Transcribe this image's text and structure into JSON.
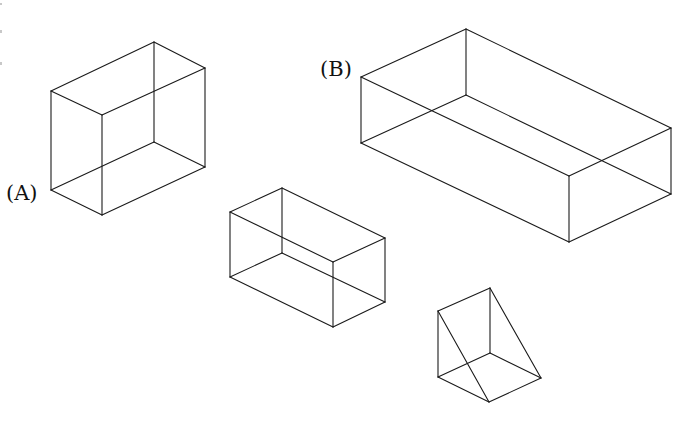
{
  "figure": {
    "background": "#ffffff",
    "line_color": "#1a1a1a",
    "labels": [
      {
        "id": "A",
        "text": "(A)",
        "x": 6,
        "y": 200
      },
      {
        "id": "B",
        "text": "(B)",
        "x": 320,
        "y": 76
      }
    ],
    "shapes": [
      {
        "name": "box-a",
        "type": "rectangular-prism",
        "label": "(A)",
        "vertices": {
          "top_left": [
            51,
            91
          ],
          "top_back": [
            154,
            42
          ],
          "top_right": [
            205,
            68
          ],
          "top_front": [
            102,
            115
          ],
          "bottom_left": [
            51,
            190
          ],
          "bottom_back": [
            154,
            142
          ],
          "bottom_right": [
            205,
            167
          ],
          "bottom_front": [
            102,
            215
          ]
        }
      },
      {
        "name": "box-b",
        "type": "rectangular-prism",
        "label": "(B)",
        "vertices": {
          "top_left": [
            361,
            77
          ],
          "top_back": [
            466,
            29
          ],
          "top_right": [
            671,
            128
          ],
          "top_front": [
            569,
            176
          ],
          "bottom_left": [
            361,
            143
          ],
          "bottom_back": [
            466,
            95
          ],
          "bottom_right": [
            671,
            194
          ],
          "bottom_front": [
            569,
            242
          ]
        }
      },
      {
        "name": "box-c",
        "type": "rectangular-prism",
        "label": "",
        "vertices": {
          "top_left": [
            230,
            212
          ],
          "top_back": [
            282,
            188
          ],
          "top_right": [
            385,
            238
          ],
          "top_front": [
            333,
            262
          ],
          "bottom_left": [
            230,
            277
          ],
          "bottom_back": [
            282,
            253
          ],
          "bottom_right": [
            385,
            302
          ],
          "bottom_front": [
            333,
            327
          ]
        }
      },
      {
        "name": "wedge-d",
        "type": "triangular-prism",
        "label": "",
        "vertices": {
          "top_left": [
            438,
            311
          ],
          "top_back": [
            490,
            288
          ],
          "bottom_left": [
            438,
            377
          ],
          "bottom_back": [
            490,
            353
          ],
          "bottom_right": [
            541,
            378
          ],
          "bottom_front": [
            489,
            402
          ]
        }
      }
    ]
  }
}
